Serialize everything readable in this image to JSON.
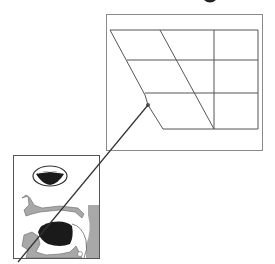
{
  "diagram": {
    "type": "vowel-chart-with-articulation",
    "colors": {
      "background": "#ffffff",
      "frame": "#8a8a8a",
      "grid": "#555555",
      "pointer": "#333333",
      "tongue": "#1a1a1a",
      "tissue": "#a8a8a8",
      "lips": "#ffffff"
    },
    "vowel_chart": {
      "frame": {
        "x": 106,
        "y": 14,
        "width": 156,
        "height": 136
      },
      "rows": 3,
      "columns": 3,
      "marked_point": {
        "x": 148,
        "y": 105
      }
    },
    "articulation_panel": {
      "frame": {
        "x": 13,
        "y": 155,
        "width": 86,
        "height": 103
      },
      "parts": [
        "lips-front-view",
        "palate",
        "tongue",
        "jaw",
        "pharynx"
      ]
    },
    "connector": {
      "from": {
        "x": 148,
        "y": 105
      },
      "to": {
        "x": 18,
        "y": 262
      }
    }
  }
}
